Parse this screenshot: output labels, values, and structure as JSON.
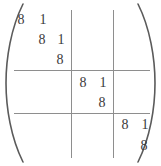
{
  "figure": {
    "kind": "block-diagonal-jordan-matrix",
    "eigenvalue": "8",
    "superdiagonal": "1",
    "rows": 7,
    "cols": 7,
    "bracket_left": "(",
    "bracket_right": ")",
    "rule_color": "#8e8e8e",
    "text_color": "#3a3a3a",
    "background": "#ffffff"
  },
  "partitions": {
    "row_splits": [
      3,
      5
    ],
    "col_splits": [
      3,
      5
    ],
    "block_sizes": [
      3,
      2,
      2
    ]
  },
  "entries": [
    {
      "id": "r1c1",
      "row": 1,
      "col": 1,
      "value": "8",
      "x": 14,
      "y": 13
    },
    {
      "id": "r1c2",
      "row": 1,
      "col": 2,
      "value": "1",
      "x": 36,
      "y": 13
    },
    {
      "id": "r2c2",
      "row": 2,
      "col": 2,
      "value": "8",
      "x": 35,
      "y": 33
    },
    {
      "id": "r2c3",
      "row": 2,
      "col": 3,
      "value": "1",
      "x": 54,
      "y": 33
    },
    {
      "id": "r3c3",
      "row": 3,
      "col": 3,
      "value": "8",
      "x": 53,
      "y": 53
    },
    {
      "id": "r4c4",
      "row": 4,
      "col": 4,
      "value": "8",
      "x": 76,
      "y": 76
    },
    {
      "id": "r4c5",
      "row": 4,
      "col": 5,
      "value": "1",
      "x": 96,
      "y": 76
    },
    {
      "id": "r5c5",
      "row": 5,
      "col": 5,
      "value": "8",
      "x": 95,
      "y": 96
    },
    {
      "id": "r6c6",
      "row": 6,
      "col": 6,
      "value": "8",
      "x": 118,
      "y": 118
    },
    {
      "id": "r6c7",
      "row": 6,
      "col": 7,
      "value": "1",
      "x": 138,
      "y": 118
    },
    {
      "id": "r7c7",
      "row": 7,
      "col": 7,
      "value": "8",
      "x": 137,
      "y": 139
    }
  ]
}
